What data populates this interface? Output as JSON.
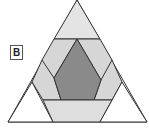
{
  "figure": {
    "label": "B",
    "colors": {
      "outer_corner_fill": "#ffffff",
      "top_triangle_fill": "#e4e4e4",
      "band_fill": "#d6d6d6",
      "bottom_trapezoid_fill": "#dedede",
      "center_fill": "#8a8a8a",
      "stroke": "#333333"
    },
    "shapes": [
      {
        "name": "outer-triangle",
        "points": "77,0 147,122 8,122"
      },
      {
        "name": "top-triangle",
        "points": "77,0 100,39 54,39"
      },
      {
        "name": "left-band",
        "points": "54,39 77,39 54,78 61,100 43,100 32,82 42,60"
      },
      {
        "name": "right-band",
        "points": "77,39 100,39 112,60 122,82 112,100 94,100 101,80"
      },
      {
        "name": "center-hexagon",
        "points": "77,39 101,80 94,100 61,100 54,78"
      },
      {
        "name": "bottom-trapezoid",
        "points": "43,100 112,100 100,122 53,122"
      },
      {
        "name": "left-corner-triangle",
        "points": "32,82 53,122 8,122"
      },
      {
        "name": "right-corner-triangle",
        "points": "122,82 147,122 100,122"
      }
    ]
  }
}
